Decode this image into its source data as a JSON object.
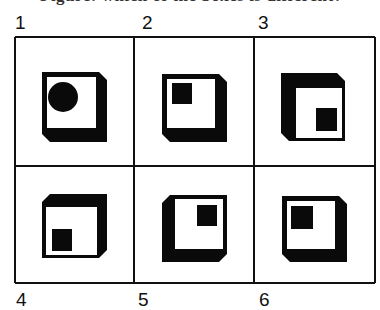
{
  "title": {
    "text": "Figure: which of the boxes is different?",
    "note": "title text cut off at top edge; only descenders visible"
  },
  "grid": {
    "rows": 2,
    "cols": 3,
    "x_lines": [
      15,
      134,
      254,
      375
    ],
    "y_lines": [
      37,
      166,
      283
    ],
    "stroke": "#111111"
  },
  "labels": [
    {
      "id": "1",
      "text": "1",
      "x": 15,
      "y": 13
    },
    {
      "id": "2",
      "text": "2",
      "x": 142,
      "y": 13
    },
    {
      "id": "3",
      "text": "3",
      "x": 258,
      "y": 13
    },
    {
      "id": "4",
      "text": "4",
      "x": 16,
      "y": 290
    },
    {
      "id": "5",
      "text": "5",
      "x": 138,
      "y": 290
    },
    {
      "id": "6",
      "text": "6",
      "x": 259,
      "y": 290
    }
  ],
  "cells": [
    {
      "id": "1",
      "thick_sides": "right-bottom",
      "outer": [
        [
          42,
          72
        ],
        [
          99,
          72
        ],
        [
          107,
          80
        ],
        [
          107,
          142
        ],
        [
          50,
          142
        ],
        [
          42,
          134
        ]
      ],
      "face": [
        47,
        77,
        49,
        51
      ],
      "marker": {
        "shape": "circle",
        "cx": 63,
        "cy": 97,
        "r": 15
      }
    },
    {
      "id": "2",
      "thick_sides": "right-bottom",
      "outer": [
        [
          162,
          74
        ],
        [
          219,
          74
        ],
        [
          227,
          82
        ],
        [
          227,
          142
        ],
        [
          170,
          142
        ],
        [
          162,
          134
        ]
      ],
      "face": [
        167,
        79,
        48,
        49
      ],
      "marker": {
        "shape": "square",
        "x": 172,
        "y": 83,
        "w": 20,
        "h": 21
      }
    },
    {
      "id": "3",
      "thick_sides": "left-top",
      "outer": [
        [
          281,
          73
        ],
        [
          337,
          73
        ],
        [
          345,
          81
        ],
        [
          345,
          141
        ],
        [
          289,
          141
        ],
        [
          281,
          133
        ]
      ],
      "face": [
        296,
        88,
        46,
        50
      ],
      "marker": {
        "shape": "square",
        "x": 316,
        "y": 108,
        "w": 21,
        "h": 23
      }
    },
    {
      "id": "4",
      "thick_sides": "right-top",
      "outer": [
        [
          50,
          194
        ],
        [
          107,
          194
        ],
        [
          107,
          250
        ],
        [
          99,
          258
        ],
        [
          42,
          258
        ],
        [
          42,
          202
        ]
      ],
      "face": [
        46,
        207,
        51,
        48
      ],
      "marker": {
        "shape": "square",
        "x": 52,
        "y": 229,
        "w": 20,
        "h": 22
      }
    },
    {
      "id": "5",
      "thick_sides": "left-bottom",
      "outer": [
        [
          170,
          195
        ],
        [
          227,
          195
        ],
        [
          227,
          254
        ],
        [
          219,
          262
        ],
        [
          162,
          262
        ],
        [
          162,
          203
        ]
      ],
      "face": [
        175,
        199,
        48,
        50
      ],
      "marker": {
        "shape": "square",
        "x": 197,
        "y": 205,
        "w": 20,
        "h": 21
      }
    },
    {
      "id": "6",
      "thick_sides": "right-bottom",
      "outer": [
        [
          282,
          196
        ],
        [
          339,
          196
        ],
        [
          347,
          204
        ],
        [
          347,
          262
        ],
        [
          290,
          262
        ],
        [
          282,
          254
        ]
      ],
      "face": [
        287,
        201,
        48,
        48
      ],
      "marker": {
        "shape": "square",
        "x": 291,
        "y": 206,
        "w": 22,
        "h": 23
      }
    }
  ],
  "colors": {
    "ink": "#0a0a0a",
    "paper": "#ffffff"
  }
}
